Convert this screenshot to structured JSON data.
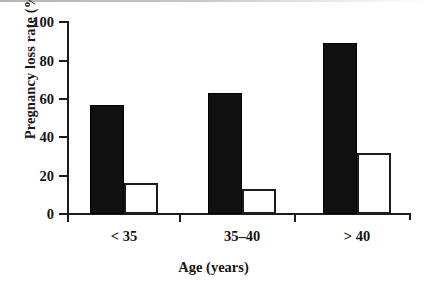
{
  "figure": {
    "background": "#ffffff",
    "ink_color": "#151515"
  },
  "chart_data": {
    "type": "bar",
    "title": "",
    "xlabel": "Age (years)",
    "ylabel": "Pregnancy loss rate (%)",
    "categories": [
      "< 35",
      "35–40",
      "> 40"
    ],
    "series": [
      {
        "name": "filled-bars",
        "fill": "#111111",
        "values": [
          57,
          63,
          89
        ]
      },
      {
        "name": "open-bars",
        "fill": "#ffffff",
        "values": [
          16,
          13,
          32
        ]
      }
    ],
    "ylim": [
      0,
      100
    ],
    "yticks": [
      0,
      20,
      40,
      60,
      80,
      100
    ],
    "ytick_labels": [
      "0",
      "20",
      "40",
      "60",
      "80",
      "100"
    ],
    "grid": false,
    "legend": "none"
  }
}
